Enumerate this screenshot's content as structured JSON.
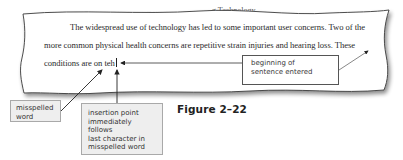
{
  "document": {
    "top_cut_text": "g Technology",
    "lines": [
      "The widespread use of technology has led to some important user concerns. Two of the",
      "more common physical health concerns are repetitive strain injuries and hearing loss. These",
      "conditions are on teh"
    ],
    "misspelled_word": "teh"
  },
  "callouts": {
    "sentence_entered": [
      "beginning of",
      "sentence entered"
    ],
    "misspelled": [
      "misspelled",
      "word"
    ],
    "insertion_point": [
      "insertion point",
      "immediately follows",
      "last character in",
      "misspelled word"
    ]
  },
  "figure": {
    "caption": "Figure 2–22"
  },
  "colors": {
    "paper": "#ffffff",
    "paper_edge": "#444444",
    "callout_gray_bg": "#eeeeee",
    "callout_border": "#555555",
    "text": "#2a2a2a"
  }
}
